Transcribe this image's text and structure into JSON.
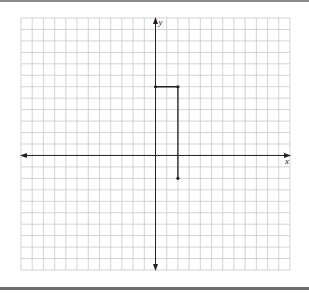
{
  "figure": {
    "type": "coordinate-plane",
    "grid": {
      "columns": 24,
      "rows": 22,
      "origin_col": 12,
      "origin_row": 12
    },
    "axes": {
      "x_label": "x",
      "y_label": "y"
    },
    "colors": {
      "grid": "#c8c8c8",
      "axis": "#222222",
      "path": "#222222",
      "rule": "#7a7a7a"
    },
    "path": {
      "points": [
        {
          "x": 0,
          "y": 6
        },
        {
          "x": 2,
          "y": 6
        },
        {
          "x": 2,
          "y": -2
        }
      ]
    }
  }
}
